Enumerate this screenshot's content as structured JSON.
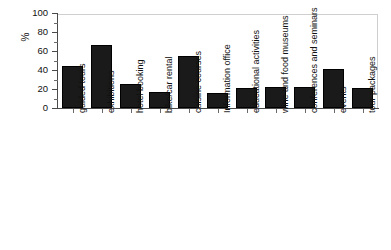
{
  "chart_data": {
    "type": "bar",
    "title": "",
    "subtitle": "",
    "xlabel": "",
    "ylabel": "%",
    "ylim": [
      0,
      100
    ],
    "ytick_labels": [
      "100",
      "80",
      "60",
      "40",
      "20",
      "0"
    ],
    "ytick_values": [
      100,
      80,
      60,
      40,
      20,
      0
    ],
    "minor_tick_step": 10,
    "grid": false,
    "legend": "none",
    "bar_color": "#1a1a1a",
    "axis_color": "#4a4a4a",
    "frame_color": "#cfcfcf",
    "categories": [
      "guided tours",
      "exhibitions",
      "hotel booking",
      "bike/car rental",
      "cuisine courses",
      "Information office",
      "educational activities",
      "wine and food museums",
      "conferences and seminars",
      "events",
      "tour packages"
    ],
    "values": [
      44,
      66,
      25,
      17,
      55,
      16,
      21,
      22,
      22,
      41,
      21
    ]
  }
}
